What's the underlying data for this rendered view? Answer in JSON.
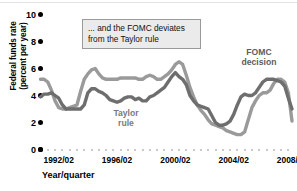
{
  "figure": {
    "callout_text_line1": "... and the FOMC deviates",
    "callout_text_line2": "from the Taylor rule",
    "ylabel_line1": "Federal funds rate",
    "ylabel_line2": "(percent per year)",
    "xaxis_title": "Year/quarter",
    "taylor_label_line1": "Taylor",
    "taylor_label_line2": "rule",
    "fomc_label_line1": "FOMC",
    "fomc_label_line2": "decision",
    "colors": {
      "taylor": "#9a9a9a",
      "fomc": "#6e6e6e",
      "callout_bg": "#ebebeb",
      "callout_border": "#9a9a9a",
      "axis_dot": "#000000",
      "minor_dot": "#b9b9b9"
    }
  },
  "chart_data": {
    "type": "line",
    "title": "",
    "xlabel": "Year/quarter",
    "ylabel": "Federal funds rate (percent per year)",
    "ylim": [
      0,
      10
    ],
    "yticks": [
      0,
      2,
      4,
      6,
      8,
      10
    ],
    "ytick_labels": [
      "0",
      "2",
      "4",
      "6",
      "8",
      "10"
    ],
    "xlim": [
      "1991/01",
      "2008/04"
    ],
    "xticks": [
      "1992/02",
      "1996/02",
      "2000/02",
      "2004/02",
      "2008/02"
    ],
    "xtick_labels": [
      "1992/02",
      "1996/02",
      "2000/02",
      "2004/02",
      "2008/02"
    ],
    "grid": false,
    "legend": "inline-annotations",
    "annotations": [
      {
        "text": "... and the FOMC deviates from the Taylor rule",
        "type": "callout-box"
      },
      {
        "text": "Taylor rule",
        "type": "series-label",
        "series": "Taylor rule"
      },
      {
        "text": "FOMC decision",
        "type": "series-label",
        "series": "FOMC decision"
      }
    ],
    "x": [
      "1991/01",
      "1991/02",
      "1991/03",
      "1991/04",
      "1992/01",
      "1992/02",
      "1992/03",
      "1992/04",
      "1993/01",
      "1993/02",
      "1993/03",
      "1993/04",
      "1994/01",
      "1994/02",
      "1994/03",
      "1994/04",
      "1995/01",
      "1995/02",
      "1995/03",
      "1995/04",
      "1996/01",
      "1996/02",
      "1996/03",
      "1996/04",
      "1997/01",
      "1997/02",
      "1997/03",
      "1997/04",
      "1998/01",
      "1998/02",
      "1998/03",
      "1998/04",
      "1999/01",
      "1999/02",
      "1999/03",
      "1999/04",
      "2000/01",
      "2000/02",
      "2000/03",
      "2000/04",
      "2001/01",
      "2001/02",
      "2001/03",
      "2001/04",
      "2002/01",
      "2002/02",
      "2002/03",
      "2002/04",
      "2003/01",
      "2003/02",
      "2003/03",
      "2003/04",
      "2004/01",
      "2004/02",
      "2004/03",
      "2004/04",
      "2005/01",
      "2005/02",
      "2005/03",
      "2005/04",
      "2006/01",
      "2006/02",
      "2006/03",
      "2006/04",
      "2007/01",
      "2007/02",
      "2007/03",
      "2007/04",
      "2008/01",
      "2008/02"
    ],
    "series": [
      {
        "name": "Taylor rule",
        "color": "#9a9a9a",
        "values": [
          5.2,
          5.2,
          5.0,
          4.4,
          3.6,
          3.1,
          3.0,
          3.0,
          3.1,
          3.2,
          3.3,
          4.3,
          5.2,
          5.6,
          5.9,
          6.0,
          5.6,
          5.3,
          5.2,
          5.2,
          5.2,
          5.2,
          5.3,
          5.3,
          5.3,
          5.3,
          5.3,
          5.2,
          5.2,
          5.4,
          5.5,
          5.4,
          5.2,
          5.2,
          5.4,
          5.6,
          5.9,
          6.3,
          6.5,
          6.3,
          5.5,
          4.6,
          3.9,
          3.3,
          2.9,
          2.6,
          2.2,
          1.9,
          1.8,
          1.7,
          1.6,
          1.4,
          1.3,
          1.2,
          1.1,
          1.1,
          1.3,
          2.2,
          3.1,
          3.6,
          4.0,
          4.2,
          4.2,
          4.4,
          4.9,
          5.2,
          5.2,
          5.0,
          4.2,
          2.1
        ]
      },
      {
        "name": "FOMC decision",
        "color": "#6e6e6e",
        "values": [
          3.9,
          4.1,
          4.1,
          4.2,
          4.0,
          3.8,
          3.3,
          3.0,
          3.0,
          3.0,
          3.0,
          3.0,
          3.3,
          4.2,
          4.5,
          4.5,
          4.3,
          4.2,
          4.0,
          3.7,
          3.6,
          3.5,
          3.6,
          3.8,
          3.9,
          3.9,
          3.7,
          3.8,
          3.6,
          3.6,
          3.9,
          4.0,
          4.2,
          4.4,
          4.6,
          5.0,
          5.4,
          5.7,
          5.4,
          5.2,
          4.8,
          4.0,
          3.6,
          3.3,
          3.2,
          3.1,
          3.0,
          2.5,
          2.0,
          1.8,
          1.8,
          1.9,
          2.1,
          2.6,
          3.3,
          3.9,
          4.1,
          4.0,
          4.0,
          4.2,
          4.6,
          5.0,
          5.2,
          5.2,
          5.2,
          5.1,
          5.0,
          4.7,
          3.8,
          3.0
        ]
      }
    ]
  }
}
